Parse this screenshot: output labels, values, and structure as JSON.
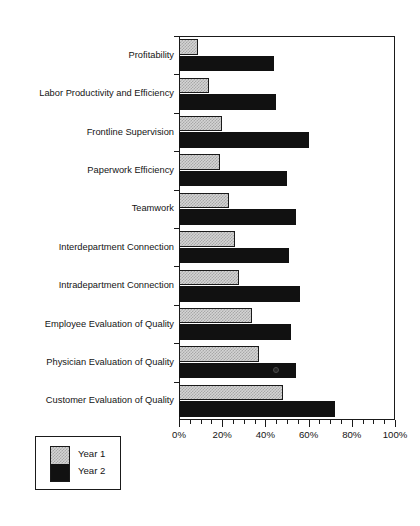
{
  "chart_data": {
    "type": "bar",
    "orientation": "horizontal",
    "title": "",
    "subtitle": "",
    "xlabel": "",
    "ylabel": "",
    "xlim": [
      0,
      100
    ],
    "grid": false,
    "legend_position": "bottom-left",
    "x_tick_labels": [
      "0%",
      "20%",
      "40%",
      "60%",
      "80%",
      "100%"
    ],
    "x_tick_values": [
      0,
      20,
      40,
      60,
      80,
      100
    ],
    "x_minor_tick_step": 5,
    "categories": [
      "Profitability",
      "Labor Productivity and Efficiency",
      "Frontline Supervision",
      "Paperwork Efficiency",
      "Teamwork",
      "Interdepartment Connection",
      "Intradepartment Connection",
      "Employee Evaluation of Quality",
      "Physician Evaluation of Quality",
      "Customer Evaluation of Quality"
    ],
    "series": [
      {
        "name": "Year 1",
        "color": "#d4d4d4",
        "values": [
          9,
          14,
          20,
          19,
          23,
          26,
          28,
          34,
          37,
          48
        ]
      },
      {
        "name": "Year 2",
        "color": "#111111",
        "values": [
          44,
          45,
          60,
          50,
          54,
          51,
          56,
          52,
          54,
          72
        ]
      }
    ]
  },
  "legend": {
    "items": [
      {
        "label": "Year 1",
        "swatch": "stipple-gray"
      },
      {
        "label": "Year 2",
        "swatch": "solid-black"
      }
    ]
  }
}
